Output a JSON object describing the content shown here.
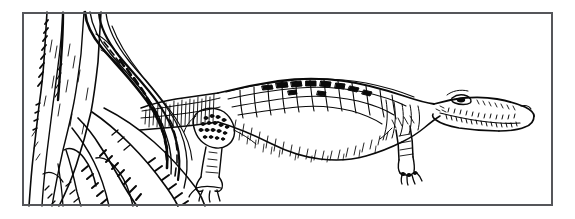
{
  "figure": {
    "kind": "line-art-illustration",
    "description": "Black ink pen-and-hatching drawing of a crocodile standing in profile facing right, its tail passing behind a large buttress-rooted tree trunk with hanging vines at the left.",
    "caption_text": "",
    "medium": "pen and ink line drawing",
    "background_color": "#ffffff",
    "ink_color": "#0a0a0a",
    "border": {
      "color": "#55565a",
      "thickness_px": 2,
      "x": 22,
      "y": 12,
      "width": 531,
      "height": 194
    },
    "subjects": [
      {
        "name": "crocodile",
        "facing": "right",
        "pose": "standing in profile",
        "parts": [
          "snout",
          "eye",
          "teeth",
          "jaw",
          "neck",
          "dorsal-scutes",
          "body",
          "front-leg",
          "hind-leg",
          "clawed-feet",
          "tail"
        ],
        "bounds": {
          "x": 140,
          "y": 70,
          "width": 400,
          "height": 115
        }
      },
      {
        "name": "tree-trunk",
        "features": [
          "buttress-roots",
          "bark-hatching",
          "hanging-vines"
        ],
        "bounds": {
          "x": 22,
          "y": 12,
          "width": 180,
          "height": 194
        }
      }
    ],
    "colors": {
      "paper": "#ffffff",
      "ink": "#0a0a0a",
      "frame": "#55565a"
    }
  }
}
